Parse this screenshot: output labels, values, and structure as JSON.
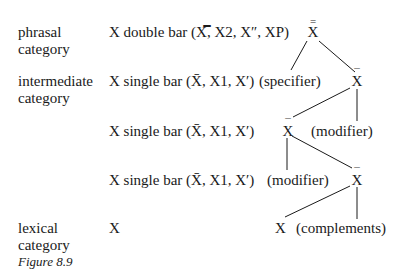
{
  "levels": [
    {
      "label_line1": "phrasal",
      "label_line2": "category",
      "notation": "X double bar (X̿, X2, X″, XP)"
    },
    {
      "label_line1": "intermediate",
      "label_line2": "category",
      "notation": "X single bar (X̄, X1, X′)"
    },
    {
      "label_line1": "",
      "label_line2": "",
      "notation": "X single bar (X̄, X1, X′)"
    },
    {
      "label_line1": "",
      "label_line2": "",
      "notation": "X single bar (X̄, X1, X′)"
    },
    {
      "label_line1": "lexical",
      "label_line2": "category",
      "notation": "X"
    }
  ],
  "caption": "Figure 8.9",
  "tree": {
    "root": "X",
    "specifier": "(specifier)",
    "xbar1": "X",
    "xbar2": "X",
    "modifier1": "(modifier)",
    "modifier2": "(modifier)",
    "xbar3": "X",
    "head": "X",
    "complements": "(complements)",
    "double_bar": "=",
    "single_bar": "¯"
  }
}
